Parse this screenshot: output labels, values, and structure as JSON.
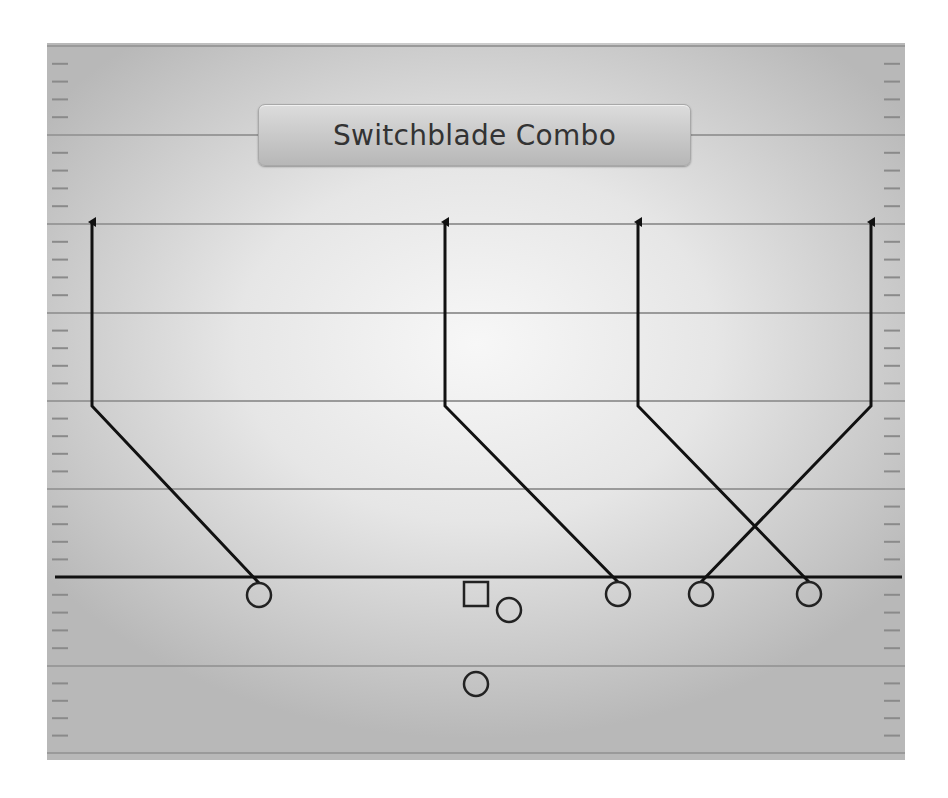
{
  "diagram": {
    "title": "Switchblade Combo",
    "type": "football-play",
    "colors": {
      "yard_line": "#9a9a9a",
      "hash_mark": "#8a8a8a",
      "line_of_scrimmage": "#111111",
      "route": "#111111",
      "player": "#222222"
    },
    "field": {
      "left": 47,
      "top": 43,
      "right": 905,
      "bottom": 760
    },
    "yard_lines_y": [
      46,
      135,
      224,
      313,
      401,
      489,
      666,
      753
    ],
    "line_of_scrimmage_y": 577,
    "players": [
      {
        "id": "receiver-1",
        "shape": "circle",
        "cx": 259,
        "cy": 595
      },
      {
        "id": "center",
        "shape": "square",
        "cx": 476,
        "cy": 594
      },
      {
        "id": "running-back",
        "shape": "circle",
        "cx": 509,
        "cy": 610
      },
      {
        "id": "quarterback",
        "shape": "circle",
        "cx": 476,
        "cy": 684
      },
      {
        "id": "receiver-2",
        "shape": "circle",
        "cx": 618,
        "cy": 594
      },
      {
        "id": "receiver-3",
        "shape": "circle",
        "cx": 701,
        "cy": 594
      },
      {
        "id": "receiver-4",
        "shape": "circle",
        "cx": 809,
        "cy": 594
      }
    ],
    "routes": [
      {
        "from": "receiver-1",
        "points": [
          [
            259,
            583
          ],
          [
            92,
            406
          ],
          [
            92,
            222
          ]
        ]
      },
      {
        "from": "receiver-2",
        "points": [
          [
            618,
            582
          ],
          [
            445,
            406
          ],
          [
            445,
            222
          ]
        ]
      },
      {
        "from": "receiver-4",
        "points": [
          [
            809,
            582
          ],
          [
            638,
            406
          ],
          [
            638,
            222
          ]
        ]
      },
      {
        "from": "receiver-3",
        "points": [
          [
            701,
            582
          ],
          [
            871,
            406
          ],
          [
            871,
            222
          ]
        ]
      }
    ]
  }
}
